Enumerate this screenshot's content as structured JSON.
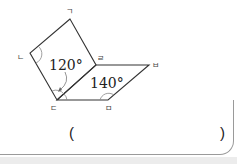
{
  "figure": {
    "vertices": {
      "giyeok": {
        "label": "ㄱ",
        "x": 70,
        "y": 19
      },
      "nieun": {
        "label": "ㄴ",
        "x": 30,
        "y": 53
      },
      "digeut": {
        "label": "ㄷ",
        "x": 57,
        "y": 100
      },
      "rieul": {
        "label": "ㄹ",
        "x": 96,
        "y": 65
      },
      "bieup": {
        "label": "ㅂ",
        "x": 149,
        "y": 65
      },
      "mieum": {
        "label": "ㅁ",
        "x": 108,
        "y": 100
      }
    },
    "shapes": [
      {
        "name": "quadrilateral",
        "points": [
          "ㄱ",
          "ㄴ",
          "ㄷ",
          "ㄹ"
        ]
      },
      {
        "name": "parallelogram",
        "points": [
          "ㄷ",
          "ㄹ",
          "ㅂ",
          "ㅁ"
        ]
      }
    ],
    "angles": {
      "angle_120": {
        "text": "120°",
        "at": "ㄷ"
      },
      "angle_140": {
        "text": "140°",
        "at": "ㅁ"
      }
    },
    "stroke_color": "#333333"
  },
  "answer": {
    "open_paren": "(",
    "close_paren": ")",
    "value": ""
  }
}
